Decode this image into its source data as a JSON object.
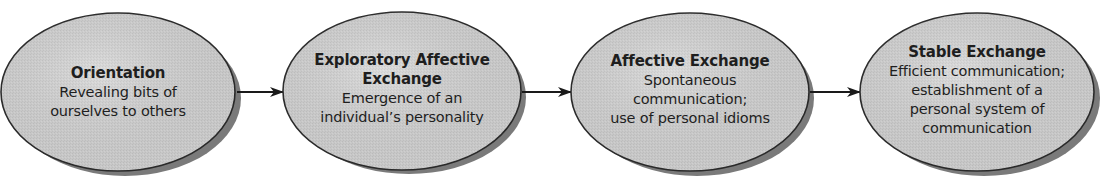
{
  "diagram": {
    "type": "linear-process-flow",
    "direction": "left-to-right",
    "colors": {
      "ellipse_fill": "#d2d2d2",
      "ellipse_stroke": "#2a2a2a",
      "shadow": "#7a7a7a",
      "arrow": "#1a1a1a",
      "text": "#1e1e1e"
    },
    "stages": [
      {
        "title": "Orientation",
        "description_lines": [
          "Revealing bits of",
          "ourselves to others"
        ]
      },
      {
        "title_lines": [
          "Exploratory Affective",
          "Exchange"
        ],
        "description_lines": [
          "Emergence of an",
          "individual’s personality"
        ]
      },
      {
        "title": "Affective Exchange",
        "description_lines": [
          "Spontaneous",
          "communication;",
          "use of personal idioms"
        ]
      },
      {
        "title": "Stable Exchange",
        "description_lines": [
          "Efficient communication;",
          "establishment of a",
          "personal system of",
          "communication"
        ]
      }
    ],
    "connectors": [
      {
        "from": 0,
        "to": 1,
        "icon": "arrow-right-icon"
      },
      {
        "from": 1,
        "to": 2,
        "icon": "arrow-right-icon"
      },
      {
        "from": 2,
        "to": 3,
        "icon": "arrow-right-icon"
      }
    ]
  }
}
